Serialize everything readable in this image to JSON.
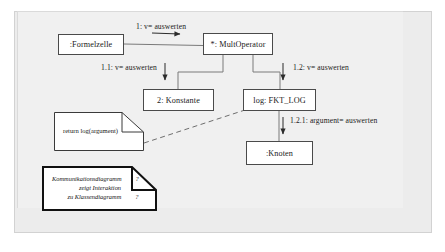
{
  "diagram": {
    "kind": "UML Kommunikationsdiagramm",
    "background_color": "#ececec",
    "line_color": "#4a4a4a",
    "box_fill": "#ffffff",
    "objects": [
      {
        "id": "formelzelle",
        "label": ":Formelzelle"
      },
      {
        "id": "multoperator",
        "label": "*: MultOperator"
      },
      {
        "id": "konstante",
        "label": "2: Konstante"
      },
      {
        "id": "fktlog",
        "label": "log: FKT_LOG"
      },
      {
        "id": "knoten",
        "label": ":Knoten"
      }
    ],
    "messages": [
      {
        "id": "m1",
        "label": "1: v= auswerten",
        "from": "formelzelle",
        "to": "multoperator"
      },
      {
        "id": "m11",
        "label": "1.1: v= auswerten",
        "from": "multoperator",
        "to": "konstante"
      },
      {
        "id": "m12",
        "label": "1.2: v= auswerten",
        "from": "multoperator",
        "to": "fktlog"
      },
      {
        "id": "m121",
        "label": "1.2.1: argument= auswerten",
        "from": "fktlog",
        "to": "knoten"
      }
    ],
    "notes": [
      {
        "id": "return-note",
        "text": "return log(argument)",
        "anchored_to": "fktlog",
        "anchor_style": "dashed"
      },
      {
        "id": "legend-note",
        "lines": [
          "Kommunikationsdiagramm",
          "zeigt Interaktion",
          "zu Klassendiagramm"
        ],
        "marks": [
          "?",
          "",
          "?"
        ],
        "style": "italic"
      }
    ]
  }
}
